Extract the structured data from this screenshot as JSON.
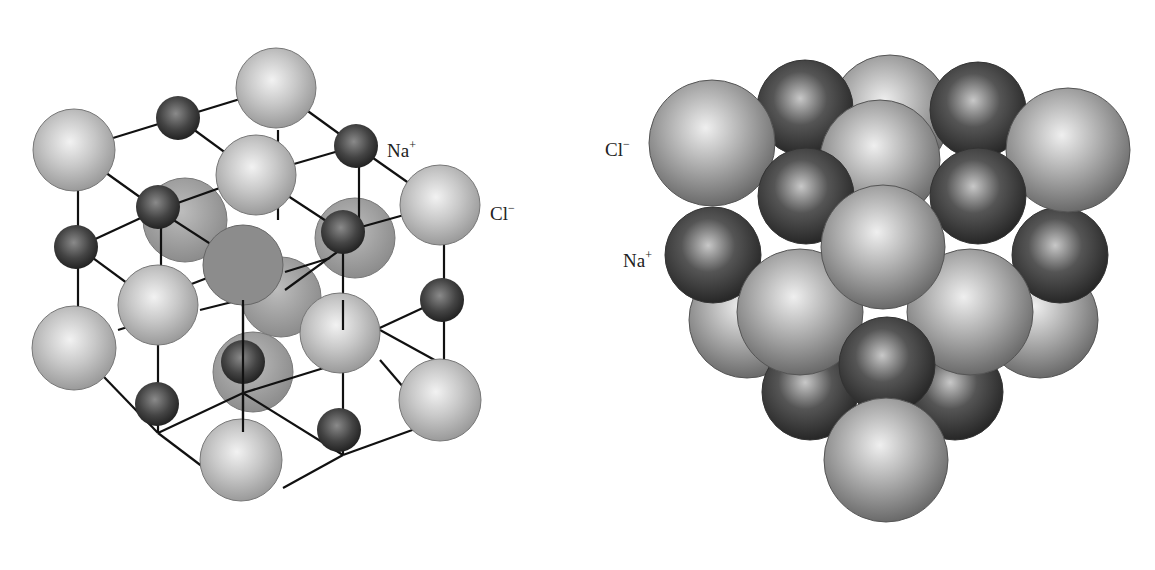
{
  "figure": {
    "left_panel": {
      "title": "Ball-and-stick NaCl lattice",
      "labels": {
        "na": {
          "symbol": "Na",
          "charge": "+"
        },
        "cl": {
          "symbol": "Cl",
          "charge": "−"
        }
      }
    },
    "right_panel": {
      "title": "Space-filling NaCl lattice",
      "labels": {
        "cl": {
          "symbol": "Cl",
          "charge": "−"
        },
        "na": {
          "symbol": "Na",
          "charge": "+"
        }
      }
    },
    "colors": {
      "cl_light": "#d6d6d6",
      "cl_mid": "#a8a8a8",
      "na_light": "#7a7a7a",
      "na_dark": "#2e2e2e",
      "bond": "#111111",
      "text": "#222222"
    }
  }
}
